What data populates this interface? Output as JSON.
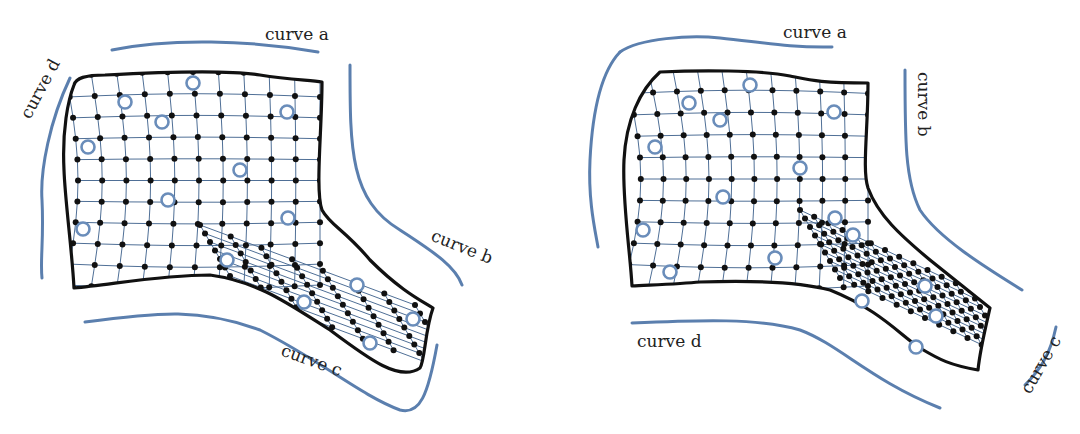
{
  "figure": {
    "left_panel": {
      "labels": {
        "a": {
          "text": "curve a",
          "x": 265,
          "y": 40,
          "rotate": 0
        },
        "b": {
          "text": "curve b",
          "x": 430,
          "y": 240,
          "rotate": 22
        },
        "c": {
          "text": "curve c",
          "x": 280,
          "y": 355,
          "rotate": 20
        },
        "d": {
          "text": "curve d",
          "x": 30,
          "y": 120,
          "rotate": -62
        }
      },
      "guides": [
        "M112,50 C170,38 250,40 318,52",
        "M350,65 C350,150 350,200 400,230 C430,250 455,265 462,285",
        "M85,322 C160,312 200,308 260,330 C320,360 360,395 400,410 C420,415 428,395 437,345",
        "M70,78 C50,120 40,170 42,200 C44,240 40,260 42,278"
      ],
      "boundary": "M74,85 C76,78 85,75 105,75 C160,72 230,70 260,75 C290,80 310,80 322,82 C322,130 315,190 322,210 C330,225 345,230 370,260 C400,290 420,300 433,308 C425,330 425,360 420,368 C400,382 370,360 330,330 C290,305 260,282 210,275 C160,275 110,285 74,288 C72,250 65,200 64,170 C62,130 68,100 74,85 Z",
      "grid_bounds": {
        "x0": 66,
        "y0": 76,
        "x1": 320,
        "y1": 285
      },
      "tail": {
        "x0": 220,
        "y0": 225,
        "x1": 435,
        "y1": 385
      },
      "controls": [
        [
          125,
          102
        ],
        [
          193,
          83
        ],
        [
          162,
          122
        ],
        [
          287,
          112
        ],
        [
          88,
          147
        ],
        [
          240,
          170
        ],
        [
          168,
          200
        ],
        [
          288,
          218
        ],
        [
          83,
          229
        ],
        [
          227,
          260
        ],
        [
          304,
          302
        ],
        [
          357,
          285
        ],
        [
          413,
          319
        ],
        [
          370,
          343
        ]
      ]
    },
    "right_panel": {
      "labels": {
        "a": {
          "text": "curve a",
          "x": 783,
          "y": 38,
          "rotate": 0
        },
        "b": {
          "text": "curve b",
          "x": 918,
          "y": 72,
          "rotate": 90
        },
        "c": {
          "text": "curve c",
          "x": 1030,
          "y": 395,
          "rotate": -60
        },
        "d": {
          "text": "curve d",
          "x": 637,
          "y": 347,
          "rotate": 0
        }
      },
      "guides": [
        "M620,52 C640,38 690,35 720,38 C760,42 790,48 832,47",
        "M620,52 C598,75 592,120 590,160 C588,200 595,230 598,247",
        "M905,70 C905,140 905,180 920,210 C940,240 990,270 1022,290",
        "M632,323 C700,320 760,318 800,330 C840,345 870,380 940,408",
        "M1025,385 C1040,370 1050,355 1056,327"
      ],
      "boundary": "M660,72 C700,70 760,70 790,76 C810,80 820,83 868,83 C868,130 862,170 868,188 C878,215 900,235 930,260 C955,280 980,300 990,308 C985,330 980,350 978,370 C950,365 940,360 920,348 C900,335 880,310 830,290 C800,282 760,280 700,282 C680,284 650,285 632,286 C630,250 622,200 624,160 C626,120 640,90 660,72 Z",
      "grid_bounds": {
        "x0": 624,
        "y0": 72,
        "x1": 868,
        "y1": 286
      },
      "tail": {
        "x0": 820,
        "y0": 210,
        "x1": 990,
        "y1": 370
      },
      "controls": [
        [
          689,
          103
        ],
        [
          750,
          85
        ],
        [
          720,
          120
        ],
        [
          834,
          112
        ],
        [
          655,
          147
        ],
        [
          800,
          168
        ],
        [
          723,
          197
        ],
        [
          835,
          218
        ],
        [
          643,
          230
        ],
        [
          670,
          272
        ],
        [
          775,
          258
        ],
        [
          862,
          301
        ],
        [
          853,
          235
        ],
        [
          925,
          286
        ],
        [
          936,
          316
        ],
        [
          916,
          347
        ]
      ]
    }
  }
}
